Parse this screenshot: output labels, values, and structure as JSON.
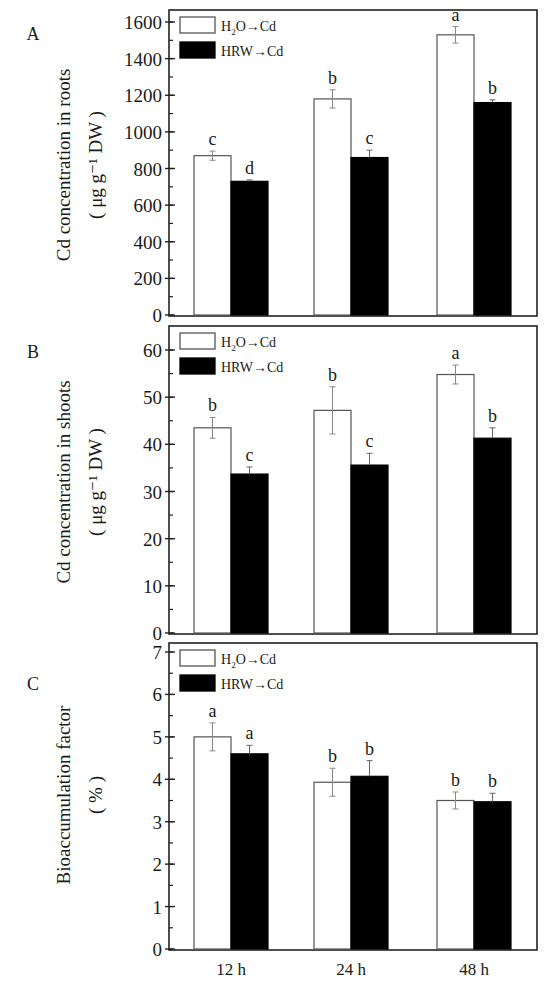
{
  "figure": {
    "categories": [
      "12 h",
      "24 h",
      "48 h"
    ],
    "legend": [
      {
        "name": "H2O→Cd",
        "label_main": "H",
        "label_sub": "2",
        "label_rest": "O→Cd",
        "fill": "#ffffff",
        "stroke": "#555555"
      },
      {
        "name": "HRW→Cd",
        "label_main": "HRW→Cd",
        "label_sub": "",
        "label_rest": "",
        "fill": "#000000",
        "stroke": "#000000"
      }
    ]
  },
  "chart_data": [
    {
      "type": "bar",
      "panel": "A",
      "ylabel_line1": "Cd concentration in roots",
      "ylabel_line2": "( μg g⁻¹ DW )",
      "categories": [
        "12 h",
        "24 h",
        "48 h"
      ],
      "ylim": [
        0,
        1600
      ],
      "yticks": [
        0,
        200,
        400,
        600,
        800,
        1000,
        1200,
        1400,
        1600
      ],
      "yminor": 100,
      "legend_position": "top-left",
      "series": [
        {
          "name": "H2O→Cd",
          "values": [
            870,
            1180,
            1530
          ],
          "errors": [
            25,
            50,
            45
          ],
          "letters": [
            "c",
            "b",
            "a"
          ]
        },
        {
          "name": "HRW→Cd",
          "values": [
            730,
            860,
            1160
          ],
          "errors": [
            8,
            40,
            15
          ],
          "letters": [
            "d",
            "c",
            "b"
          ]
        }
      ]
    },
    {
      "type": "bar",
      "panel": "B",
      "ylabel_line1": "Cd concentration in shoots",
      "ylabel_line2": "( μg g⁻¹ DW )",
      "categories": [
        "12 h",
        "24 h",
        "48 h"
      ],
      "ylim": [
        0,
        65
      ],
      "yticks": [
        0,
        10,
        20,
        30,
        40,
        50,
        60
      ],
      "yminor": 5,
      "legend_position": "top-left",
      "series": [
        {
          "name": "H2O→Cd",
          "values": [
            43.5,
            47.2,
            54.8
          ],
          "errors": [
            2.2,
            5.0,
            2.0
          ],
          "letters": [
            "b",
            "b",
            "a"
          ]
        },
        {
          "name": "HRW→Cd",
          "values": [
            33.7,
            35.6,
            41.3
          ],
          "errors": [
            1.5,
            2.5,
            2.2
          ],
          "letters": [
            "c",
            "c",
            "b"
          ]
        }
      ]
    },
    {
      "type": "bar",
      "panel": "C",
      "ylabel_line1": "Bioaccumulation factor",
      "ylabel_line2": "( % )",
      "categories": [
        "12 h",
        "24 h",
        "48 h"
      ],
      "ylim": [
        0,
        7
      ],
      "yticks": [
        0,
        1,
        2,
        3,
        4,
        5,
        6,
        7
      ],
      "yminor": 0.5,
      "legend_position": "top-left",
      "series": [
        {
          "name": "H2O→Cd",
          "values": [
            5.0,
            3.93,
            3.5
          ],
          "errors": [
            0.33,
            0.33,
            0.2
          ],
          "letters": [
            "a",
            "b",
            "b"
          ]
        },
        {
          "name": "HRW→Cd",
          "values": [
            4.6,
            4.07,
            3.47
          ],
          "errors": [
            0.2,
            0.37,
            0.2
          ],
          "letters": [
            "a",
            "b",
            "b"
          ]
        }
      ]
    }
  ]
}
